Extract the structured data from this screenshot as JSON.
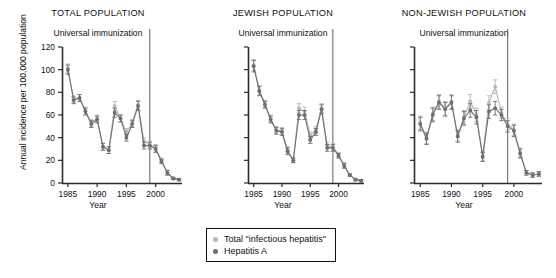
{
  "figure": {
    "y_axis_title": "Annual incidence per 100,000 population",
    "x_axis_title": "Year",
    "immunization_label": "Universal immunization"
  },
  "legend": {
    "items": [
      {
        "label": "Total \"infectious hepatitis\"",
        "color": "#b8b8b8"
      },
      {
        "label": "Hepatitis A",
        "color": "#6e6e6e"
      }
    ]
  },
  "chart_data": [
    {
      "type": "line",
      "title": "TOTAL POPULATION",
      "xlabel": "Year",
      "ylabel": "Annual incidence per 100,000 population",
      "xlim": [
        1984,
        2004.5
      ],
      "ylim": [
        0,
        120
      ],
      "yticks": [
        0,
        20,
        40,
        60,
        80,
        100,
        120
      ],
      "xticks": [
        1985,
        1990,
        1995,
        2000
      ],
      "grid": false,
      "legend_position": "below-figure",
      "annotations": [
        {
          "text": "Universal immunization",
          "type": "vline",
          "x": 1999
        }
      ],
      "x": [
        1985,
        1986,
        1987,
        1988,
        1989,
        1990,
        1991,
        1992,
        1993,
        1994,
        1995,
        1996,
        1997,
        1998,
        1999,
        2000,
        2001,
        2002,
        2003,
        2004
      ],
      "series": [
        {
          "name": "Total \"infectious hepatitis\"",
          "color": "#b8b8b8",
          "values": [
            101,
            74,
            75,
            64,
            53,
            57,
            32,
            29,
            68,
            57,
            45,
            53,
            69,
            37,
            34,
            31,
            20,
            9,
            4,
            3
          ],
          "errors": [
            4,
            3,
            3,
            3,
            3,
            3,
            3,
            3,
            4,
            3,
            3,
            3,
            4,
            3,
            3,
            3,
            2,
            2,
            1,
            1
          ]
        },
        {
          "name": "Hepatitis A",
          "color": "#6e6e6e",
          "values": [
            100,
            73,
            75,
            63,
            52,
            56,
            32,
            29,
            62,
            57,
            40,
            52,
            68,
            33,
            33,
            30,
            19,
            9,
            4,
            3
          ],
          "errors": [
            4,
            3,
            3,
            3,
            3,
            3,
            3,
            3,
            4,
            3,
            3,
            3,
            4,
            3,
            3,
            3,
            2,
            2,
            1,
            1
          ]
        }
      ]
    },
    {
      "type": "line",
      "title": "JEWISH POPULATION",
      "xlabel": "Year",
      "ylabel": "",
      "xlim": [
        1984,
        2004.5
      ],
      "ylim": [
        0,
        120
      ],
      "yticks": [
        0,
        20,
        40,
        60,
        80,
        100,
        120
      ],
      "xticks": [
        1985,
        1990,
        1995,
        2000
      ],
      "grid": false,
      "legend_position": "below-figure",
      "annotations": [
        {
          "text": "Universal immunization",
          "type": "vline",
          "x": 1999
        }
      ],
      "x": [
        1985,
        1986,
        1987,
        1988,
        1989,
        1990,
        1991,
        1992,
        1993,
        1994,
        1995,
        1996,
        1997,
        1998,
        1999,
        2000,
        2001,
        2002,
        2003,
        2004
      ],
      "series": [
        {
          "name": "Total \"infectious hepatitis\"",
          "color": "#b8b8b8",
          "values": [
            104,
            82,
            70,
            57,
            47,
            46,
            29,
            20,
            66,
            63,
            42,
            47,
            66,
            33,
            32,
            25,
            16,
            7,
            3,
            2
          ],
          "errors": [
            5,
            4,
            3,
            3,
            3,
            3,
            3,
            2,
            4,
            4,
            3,
            3,
            4,
            3,
            3,
            2,
            2,
            1,
            1,
            1
          ]
        },
        {
          "name": "Hepatitis A",
          "color": "#6e6e6e",
          "values": [
            103,
            81,
            69,
            56,
            46,
            45,
            28,
            20,
            60,
            60,
            38,
            45,
            65,
            31,
            31,
            24,
            15,
            7,
            3,
            2
          ],
          "errors": [
            5,
            4,
            3,
            3,
            3,
            3,
            3,
            2,
            4,
            4,
            3,
            3,
            4,
            3,
            3,
            2,
            2,
            1,
            1,
            1
          ]
        }
      ]
    },
    {
      "type": "line",
      "title": "NON-JEWISH POPULATION",
      "xlabel": "Year",
      "ylabel": "",
      "xlim": [
        1984,
        2004.5
      ],
      "ylim": [
        0,
        120
      ],
      "yticks": [
        0,
        20,
        40,
        60,
        80,
        100,
        120
      ],
      "xticks": [
        1985,
        1990,
        1995,
        2000
      ],
      "grid": false,
      "legend_position": "below-figure",
      "annotations": [
        {
          "text": "Universal immunization",
          "type": "vline",
          "x": 1999
        }
      ],
      "x": [
        1985,
        1986,
        1987,
        1988,
        1989,
        1990,
        1991,
        1992,
        1993,
        1994,
        1995,
        1996,
        1997,
        1998,
        1999,
        2000,
        2001,
        2002,
        2003,
        2004
      ],
      "series": [
        {
          "name": "Total \"infectious hepatitis\"",
          "color": "#b8b8b8",
          "values": [
            53,
            40,
            61,
            72,
            66,
            72,
            42,
            58,
            72,
            60,
            24,
            71,
            85,
            62,
            52,
            47,
            27,
            9,
            7,
            8
          ],
          "errors": [
            6,
            5,
            6,
            6,
            6,
            6,
            5,
            6,
            6,
            6,
            4,
            6,
            6,
            5,
            5,
            5,
            4,
            2,
            2,
            2
          ]
        },
        {
          "name": "Hepatitis A",
          "color": "#6e6e6e",
          "values": [
            52,
            39,
            60,
            71,
            65,
            71,
            41,
            57,
            64,
            58,
            23,
            63,
            66,
            60,
            50,
            46,
            26,
            9,
            7,
            8
          ],
          "errors": [
            6,
            5,
            6,
            6,
            6,
            6,
            5,
            6,
            6,
            6,
            4,
            6,
            6,
            5,
            5,
            5,
            4,
            2,
            2,
            2
          ]
        }
      ]
    }
  ]
}
